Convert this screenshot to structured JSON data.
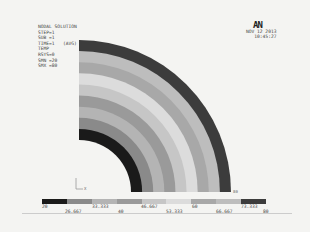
{
  "header": {
    "title": "NODAL SOLUTION",
    "lines": [
      "STEP=1",
      "SUB =1",
      "TIME=1",
      "TEMP",
      "RSYS=0",
      "SMN =20",
      "SMX =80"
    ],
    "avg_label": "(AVG)",
    "logo": "AN",
    "date": "NOV 12 2013",
    "time": "10:45:27"
  },
  "axis_triad": {
    "label": "X"
  },
  "node_label": "80",
  "contour": {
    "center_px": [
      79,
      192
    ],
    "outer_radius_px": 152,
    "inner_radius_px": 52,
    "bands": [
      "#1a1a1a",
      "#8a8a8a",
      "#b4b4b4",
      "#9a9a9a",
      "#c6c6c6",
      "#dcdcdc",
      "#a8a8a8",
      "#bdbdbd",
      "#3c3c3c"
    ]
  },
  "legend": {
    "colors": [
      "#1a1a1a",
      "#8a8a8a",
      "#b4b4b4",
      "#9a9a9a",
      "#c6c6c6",
      "#dcdcdc",
      "#a8a8a8",
      "#bdbdbd",
      "#3c3c3c"
    ],
    "labels_top": [
      "20",
      "33.333",
      "46.667",
      "60",
      "73.333"
    ],
    "labels_bottom": [
      "26.667",
      "40",
      "53.333",
      "66.667",
      "80"
    ]
  }
}
